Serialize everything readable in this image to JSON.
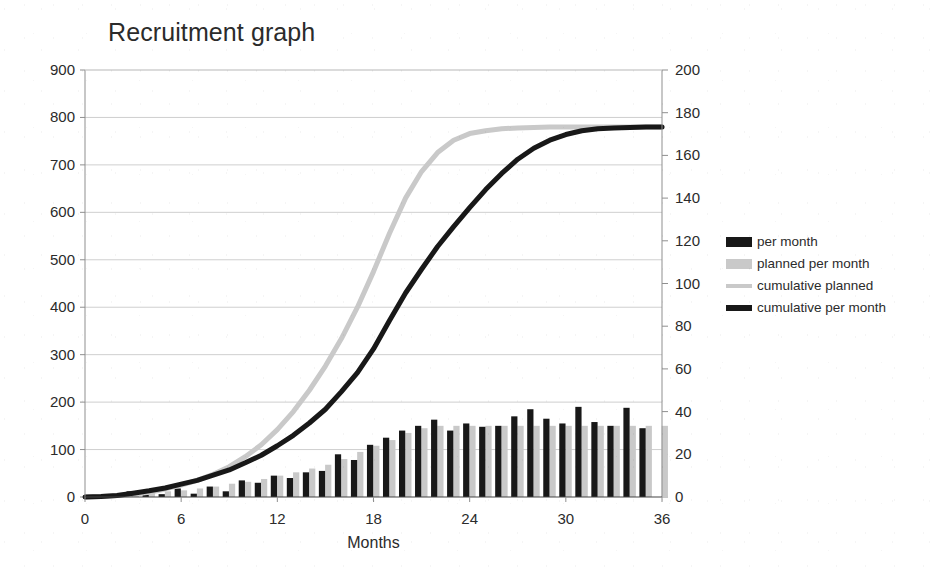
{
  "chart_data": {
    "type": "bar",
    "title": "Recruitment graph",
    "xlabel": "Months",
    "ylabel": "",
    "xlim": [
      0,
      36
    ],
    "xticks": [
      0,
      6,
      12,
      18,
      24,
      30,
      36
    ],
    "ylim_left": [
      0,
      900
    ],
    "yticks_left": [
      0,
      100,
      200,
      300,
      400,
      500,
      600,
      700,
      800,
      900
    ],
    "ylim_right": [
      0,
      200
    ],
    "yticks_right": [
      0,
      20,
      40,
      60,
      80,
      100,
      120,
      140,
      160,
      180,
      200
    ],
    "grid": true,
    "legend_position": "right",
    "x": [
      1,
      2,
      3,
      4,
      5,
      6,
      7,
      8,
      9,
      10,
      11,
      12,
      13,
      14,
      15,
      16,
      17,
      18,
      19,
      20,
      21,
      22,
      23,
      24,
      25,
      26,
      27,
      28,
      29,
      30,
      31,
      32,
      33,
      34,
      35,
      36
    ],
    "series": [
      {
        "name": "per month",
        "kind": "bar",
        "axis": "left",
        "color": "#181818",
        "values": [
          0,
          2,
          12,
          5,
          6,
          18,
          7,
          22,
          12,
          35,
          30,
          45,
          40,
          52,
          55,
          90,
          78,
          110,
          125,
          140,
          150,
          163,
          140,
          155,
          148,
          150,
          170,
          185,
          165,
          155,
          190,
          158,
          150,
          188,
          145,
          0
        ]
      },
      {
        "name": "planned per month",
        "kind": "bar",
        "axis": "left",
        "color": "#c9c9c9",
        "values": [
          2,
          4,
          6,
          8,
          12,
          14,
          18,
          22,
          28,
          32,
          38,
          45,
          52,
          60,
          68,
          80,
          95,
          108,
          120,
          135,
          145,
          150,
          150,
          150,
          150,
          150,
          150,
          150,
          150,
          150,
          150,
          150,
          150,
          150,
          150,
          150
        ]
      },
      {
        "name": "cumulative planned",
        "kind": "line",
        "axis": "left",
        "color": "#c9c9c9",
        "values": [
          2,
          6,
          12,
          20,
          32,
          46,
          64,
          86,
          114,
          146,
          184,
          229,
          281,
          341,
          409,
          489,
          584,
          692,
          812,
          947,
          1092,
          1242,
          1392,
          1542,
          1692,
          1842,
          1992,
          2142,
          2292,
          2442,
          2592,
          2742,
          2892,
          3042,
          3192,
          3342
        ],
        "values_scaled_left": [
          1,
          3,
          6,
          10,
          17,
          25,
          35,
          48,
          64,
          85,
          110,
          142,
          180,
          225,
          276,
          334,
          400,
          475,
          556,
          630,
          686,
          726,
          752,
          766,
          772,
          776,
          778,
          779,
          780,
          780,
          780,
          780,
          780,
          780,
          780,
          780
        ]
      },
      {
        "name": "cumulative per month",
        "kind": "line",
        "axis": "left",
        "color": "#181818",
        "values_scaled_left": [
          1,
          3,
          8,
          13,
          19,
          27,
          35,
          46,
          57,
          72,
          88,
          108,
          130,
          156,
          185,
          222,
          262,
          312,
          372,
          430,
          480,
          528,
          570,
          610,
          648,
          682,
          712,
          735,
          752,
          764,
          772,
          776,
          778,
          779,
          780,
          780
        ]
      }
    ]
  },
  "legend": {
    "items": [
      {
        "label": "per month",
        "swatch": "bar-dark"
      },
      {
        "label": "planned per month",
        "swatch": "bar-light"
      },
      {
        "label": "cumulative planned",
        "swatch": "line-light"
      },
      {
        "label": "cumulative per month",
        "swatch": "line-dark"
      }
    ]
  },
  "colors": {
    "dark": "#181818",
    "light": "#c9c9c9",
    "grid": "#cfcfcf",
    "axis": "#8f8f8f",
    "text": "#2b2b2b",
    "background": "#ffffff"
  }
}
